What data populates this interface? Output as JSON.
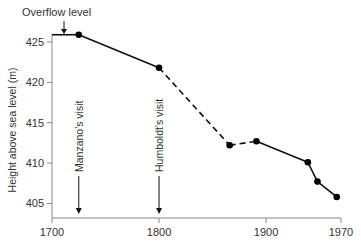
{
  "chart_data": {
    "type": "line",
    "title": "",
    "xlabel": "",
    "ylabel": "Height above sea level (m)",
    "xlim": [
      1700,
      1970
    ],
    "ylim": [
      403.2,
      426
    ],
    "x_ticks": [
      1700,
      1800,
      1900,
      1970
    ],
    "y_ticks": [
      405,
      410,
      415,
      420,
      425
    ],
    "grid": false,
    "series": [
      {
        "name": "Lake level",
        "points": [
          {
            "x": 1725,
            "y": 425.9
          },
          {
            "x": 1800,
            "y": 421.8
          },
          {
            "x": 1866,
            "y": 412.2
          },
          {
            "x": 1891,
            "y": 412.7
          },
          {
            "x": 1939,
            "y": 410.1
          },
          {
            "x": 1948,
            "y": 407.7
          },
          {
            "x": 1966,
            "y": 405.8
          }
        ],
        "dashed_segments": [
          [
            1,
            2
          ],
          [
            2,
            3
          ]
        ]
      }
    ],
    "overflow": {
      "label": "Overflow level",
      "y": 425.9,
      "x_start": 1700,
      "x_end": 1725
    },
    "annotations": [
      {
        "label": "Manzano's visit",
        "x": 1725
      },
      {
        "label": "Humboldt's visit",
        "x": 1800
      }
    ]
  }
}
